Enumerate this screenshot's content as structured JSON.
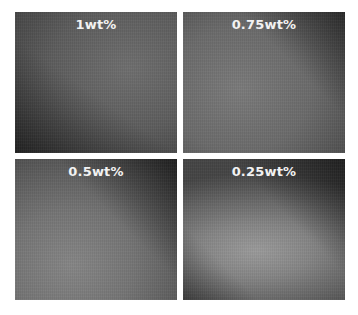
{
  "figure": {
    "layout": "2x2 grid",
    "panels": [
      {
        "label": "1wt%",
        "position": "top-left"
      },
      {
        "label": "0.75wt%",
        "position": "top-right"
      },
      {
        "label": "0.5wt%",
        "position": "bottom-left"
      },
      {
        "label": "0.25wt%",
        "position": "bottom-right"
      }
    ],
    "label_color": "#f2f2f2",
    "background_color": "#ffffff"
  }
}
